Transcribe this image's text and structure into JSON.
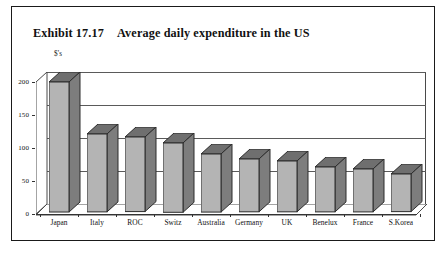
{
  "exhibit": {
    "number": "Exhibit 17.17",
    "title": "Average daily expenditure in the US"
  },
  "chart_data": {
    "type": "bar",
    "title": "Average daily expenditure in the US",
    "xlabel": "",
    "ylabel": "$'s",
    "ylim": [
      0,
      200
    ],
    "yticks": [
      0,
      50,
      100,
      150,
      200
    ],
    "grid": true,
    "legend": "none",
    "style": "3d-column",
    "categories": [
      "Japan",
      "Italy",
      "ROC",
      "Switz",
      "Australia",
      "Germany",
      "UK",
      "Benelux",
      "France",
      "S.Korea"
    ],
    "values": [
      197,
      118,
      113,
      105,
      88,
      80,
      77,
      68,
      65,
      57
    ],
    "colors": {
      "bar_front": "#b4b4b4",
      "bar_side": "#7d7d7d",
      "bar_top": "#6f6f6f",
      "outline": "#2c2c2c",
      "gridline": "#5a5a5a",
      "frame": "#1a1a1a",
      "floor": "#9b9b9b",
      "wall": "#d9d9d9",
      "background": "#ffffff"
    }
  },
  "axis": {
    "unit_label": "$'s",
    "tick_labels": [
      "200",
      "150",
      "100",
      "50",
      "0"
    ]
  }
}
